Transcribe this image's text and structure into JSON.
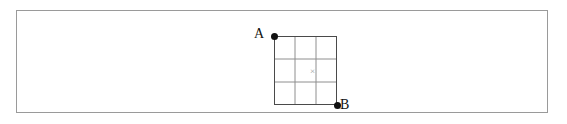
{
  "figure": {
    "background_color": "#ffffff",
    "frame": {
      "name": "figure-border",
      "color": "#9a9a9a",
      "x": 16,
      "y": 10,
      "width": 532,
      "height": 103
    },
    "grid": {
      "rows": 3,
      "cols": 3,
      "x": 257,
      "y": 25,
      "width": 63,
      "height": 69,
      "cell_width": 21,
      "cell_height": 23,
      "outer_line_color": "#4a4a4a",
      "inner_line_color": "#8e8e8e"
    },
    "points": [
      {
        "id": "A",
        "label": "A",
        "position": "top-left",
        "dot_color": "#111111",
        "x": 257,
        "y": 25
      },
      {
        "id": "B",
        "label": "B",
        "position": "bottom-right",
        "dot_color": "#111111",
        "x": 320,
        "y": 94
      }
    ],
    "center_mark": {
      "name": "x-mark",
      "symbol": "×",
      "color": "#9b9b9b",
      "x": 295,
      "y": 60
    }
  }
}
